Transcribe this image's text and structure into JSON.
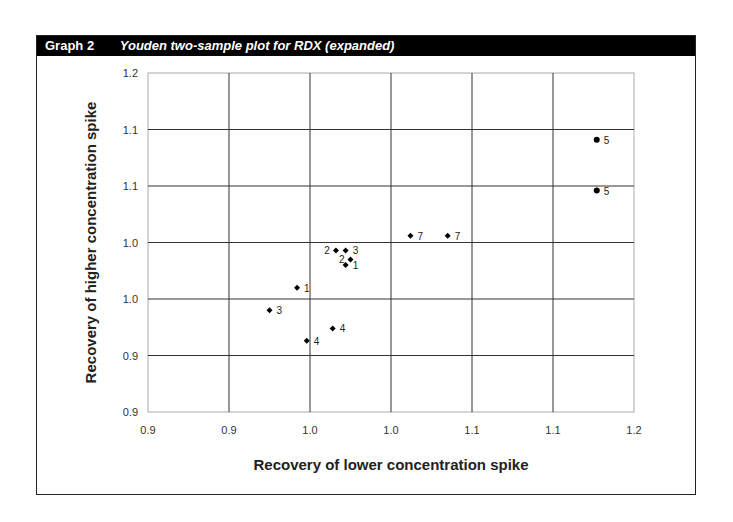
{
  "header": {
    "number": "Graph 2",
    "title": "Youden two-sample plot for RDX (expanded)"
  },
  "chart_data": {
    "type": "scatter",
    "title": "Youden two-sample plot for RDX (expanded)",
    "xlabel": "Recovery of lower concentration spike",
    "ylabel": "Recovery of higher concentration spike",
    "xlim": [
      0.9,
      1.2
    ],
    "ylim": [
      0.9,
      1.2
    ],
    "x_ticks": [
      "0.9",
      "0.9",
      "1.0",
      "1.0",
      "1.1",
      "1.1",
      "1.2"
    ],
    "y_ticks": [
      "0.9",
      "0.9",
      "0.9",
      "1.0",
      "1.0",
      "1.1",
      "1.1",
      "1.2"
    ],
    "grid": true,
    "legend": "none",
    "points": [
      {
        "label": "5",
        "x": 1.177,
        "y": 1.141,
        "marker": "circle"
      },
      {
        "label": "5",
        "x": 1.177,
        "y": 1.096,
        "marker": "circle"
      },
      {
        "label": "7",
        "x": 1.062,
        "y": 1.056,
        "marker": "diamond"
      },
      {
        "label": "7",
        "x": 1.085,
        "y": 1.056,
        "marker": "diamond"
      },
      {
        "label": "2",
        "x": 1.016,
        "y": 1.043,
        "marker": "diamond",
        "label_side": "left"
      },
      {
        "label": "3",
        "x": 1.022,
        "y": 1.043,
        "marker": "diamond"
      },
      {
        "label": "2",
        "x": 1.025,
        "y": 1.035,
        "marker": "diamond",
        "label_side": "left"
      },
      {
        "label": "1",
        "x": 1.022,
        "y": 1.03,
        "marker": "diamond"
      },
      {
        "label": "1",
        "x": 0.992,
        "y": 1.01,
        "marker": "diamond"
      },
      {
        "label": "3",
        "x": 0.975,
        "y": 0.99,
        "marker": "diamond"
      },
      {
        "label": "4",
        "x": 1.014,
        "y": 0.974,
        "marker": "diamond"
      },
      {
        "label": "4",
        "x": 0.998,
        "y": 0.963,
        "marker": "diamond"
      }
    ]
  }
}
